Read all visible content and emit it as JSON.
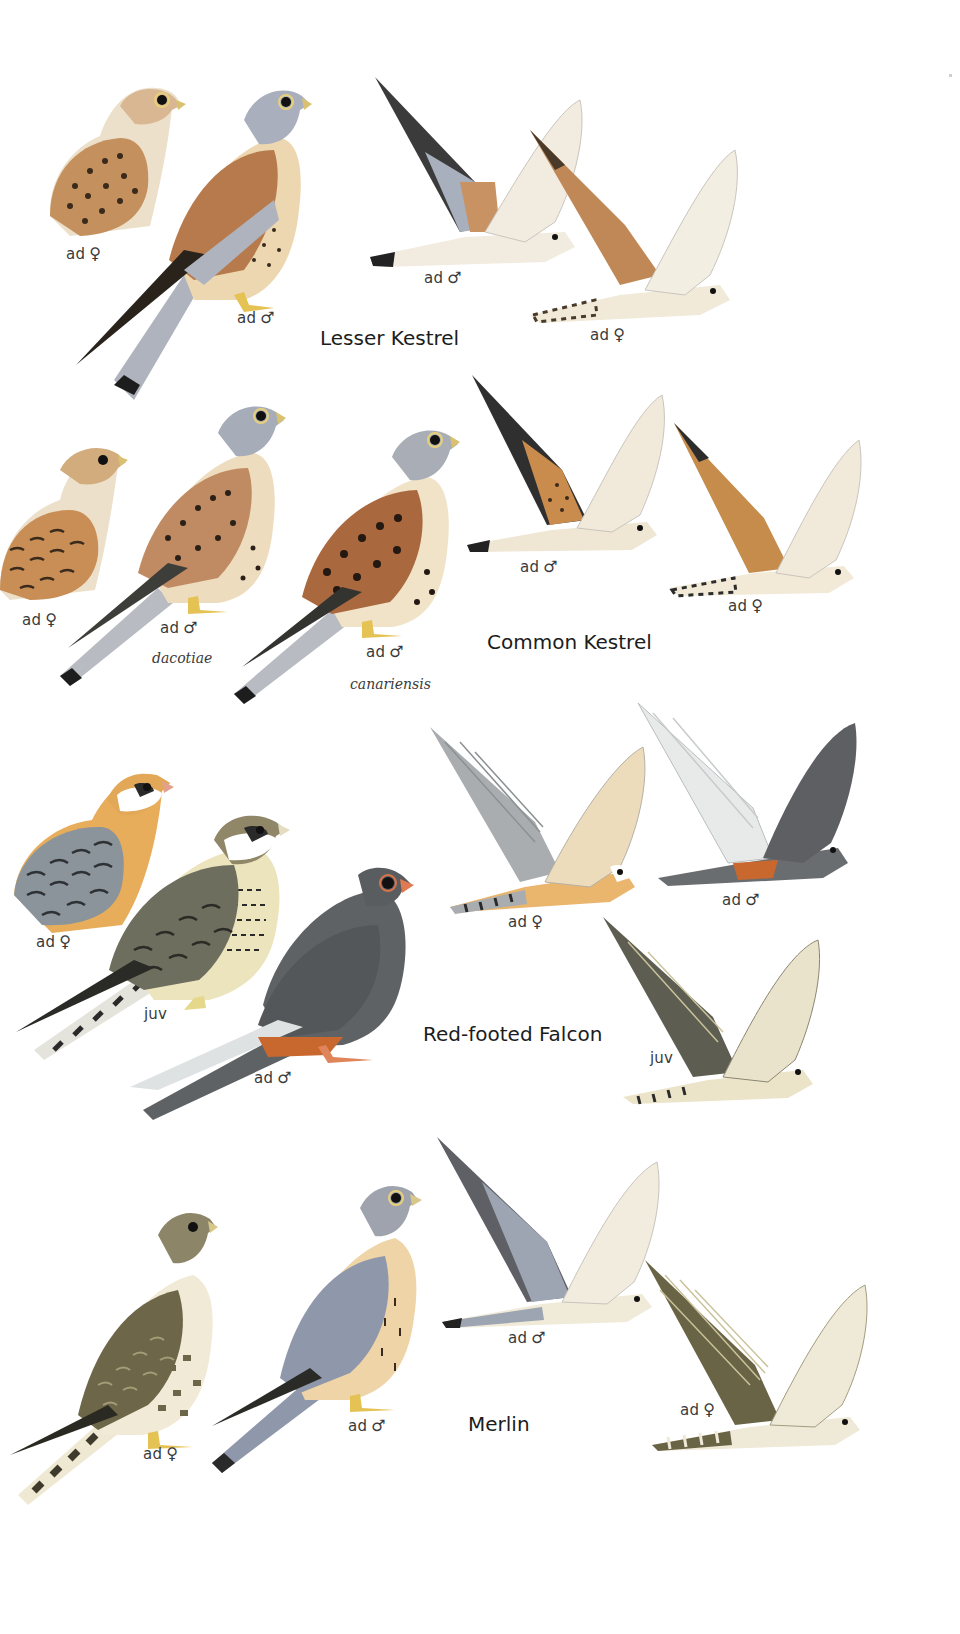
{
  "plate": {
    "background": "#ffffff",
    "species": [
      {
        "name": "Lesser Kestrel",
        "figures": [
          {
            "pose": "perched",
            "label": "ad",
            "sex": "♀",
            "colors": {
              "back": "#c4915e",
              "head": "#d8b792",
              "spots": "#3a2a1c"
            }
          },
          {
            "pose": "perched",
            "label": "ad",
            "sex": "♂",
            "colors": {
              "head": "#a9afbd",
              "back": "#b77a4c",
              "tail": "#aeb3bd",
              "breast": "#ecd7b0"
            }
          },
          {
            "pose": "flight",
            "label": "ad",
            "sex": "♂",
            "colors": {
              "wing": "#3b3b3b",
              "body": "#f2ebe0",
              "accent": "#c99263"
            }
          },
          {
            "pose": "flight",
            "label": "ad",
            "sex": "♀",
            "colors": {
              "wing": "#c08856",
              "body": "#f1ead9",
              "accent": "#4a3a2a"
            }
          }
        ]
      },
      {
        "name": "Common Kestrel",
        "figures": [
          {
            "pose": "perched",
            "label": "ad",
            "sex": "♀",
            "colors": {
              "back": "#c88e55",
              "head": "#d2ac7d",
              "spots": "#3a2a1c"
            }
          },
          {
            "pose": "perched",
            "label": "ad",
            "sex": "♂",
            "subspecies": "dacotiae",
            "colors": {
              "head": "#a7adb8",
              "back": "#c08b62",
              "breast": "#eedcbf"
            }
          },
          {
            "pose": "perched",
            "label": "ad",
            "sex": "♂",
            "subspecies": "canariensis",
            "colors": {
              "head": "#a9aeb6",
              "back": "#a9683e",
              "breast": "#f1e3c8"
            }
          },
          {
            "pose": "flight",
            "label": "ad",
            "sex": "♂",
            "colors": {
              "wing": "#2f2f2f",
              "body": "#efe6d4",
              "accent": "#c98c4d"
            }
          },
          {
            "pose": "flight",
            "label": "ad",
            "sex": "♀",
            "colors": {
              "wing": "#c58c4c",
              "body": "#f2ead7",
              "accent": "#2c2c2c"
            }
          }
        ]
      },
      {
        "name": "Red-footed Falcon",
        "figures": [
          {
            "pose": "perched",
            "label": "ad",
            "sex": "♀",
            "colors": {
              "back": "#8c949b",
              "head": "#e3a857",
              "breast": "#e8ad5a"
            }
          },
          {
            "pose": "perched",
            "label": "juv",
            "sex": "",
            "colors": {
              "back": "#6e6e5f",
              "head": "#8f8767",
              "breast": "#ece4bd"
            }
          },
          {
            "pose": "perched",
            "label": "ad",
            "sex": "♂",
            "colors": {
              "body": "#5f6265",
              "vent": "#c8682e",
              "wing": "#dfe2e2"
            }
          },
          {
            "pose": "flight",
            "label": "ad",
            "sex": "♀",
            "colors": {
              "wing": "#a9adaf",
              "body": "#eab56d",
              "accent": "#ffffff"
            }
          },
          {
            "pose": "flight",
            "label": "ad",
            "sex": "♂",
            "colors": {
              "wing": "#5d5f62",
              "body": "#6a6d70",
              "accent": "#c8682e"
            }
          },
          {
            "pose": "flight",
            "label": "juv",
            "sex": "",
            "colors": {
              "wing": "#5d5d52",
              "body": "#ece4c9",
              "accent": "#2a2a2a"
            }
          }
        ]
      },
      {
        "name": "Merlin",
        "figures": [
          {
            "pose": "perched",
            "label": "ad",
            "sex": "♀",
            "colors": {
              "back": "#6d6648",
              "head": "#8d8568",
              "breast": "#f0ead7"
            }
          },
          {
            "pose": "perched",
            "label": "ad",
            "sex": "♂",
            "colors": {
              "back": "#8f97aa",
              "head": "#9ea3ad",
              "breast": "#efd4a8"
            }
          },
          {
            "pose": "flight",
            "label": "ad",
            "sex": "♂",
            "colors": {
              "wing": "#5e6066",
              "body": "#f0ead8",
              "accent": "#9ea5b2"
            }
          },
          {
            "pose": "flight",
            "label": "ad",
            "sex": "♀",
            "colors": {
              "wing": "#6a6446",
              "body": "#efe9d7",
              "accent": "#2b2b2b"
            }
          }
        ]
      }
    ]
  }
}
